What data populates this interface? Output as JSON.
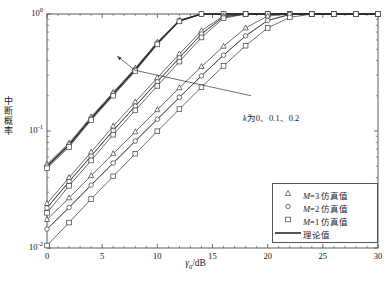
{
  "chart_data": {
    "type": "line",
    "title": "",
    "xlabel": "γ₀/dB",
    "ylabel": "中断概率",
    "xlim": [
      0,
      30
    ],
    "ylim": [
      0.01,
      1
    ],
    "yscale": "log",
    "xscale": "linear",
    "grid": false,
    "xticks": [
      0,
      5,
      10,
      15,
      20,
      25,
      30
    ],
    "xtick_labels": [
      "0",
      "5",
      "10",
      "15",
      "20",
      "25",
      "30"
    ],
    "yticks": [
      0.01,
      0.1,
      1
    ],
    "ytick_labels": [
      "10-2",
      "10-1",
      "100"
    ],
    "ytick_mantissa": "10",
    "ytick_exponents": [
      "0",
      "-1",
      "-2"
    ],
    "legend_position": "lower right",
    "annotations": [
      {
        "text": "k为0、0.1、0.2",
        "x": 18.5,
        "y": 0.2,
        "arrow_to_x": 8.0,
        "arrow_to_y": 0.33
      }
    ],
    "x": [
      0,
      2,
      4,
      6,
      8,
      10,
      12,
      14,
      16,
      18,
      20,
      22,
      24,
      26,
      28,
      30
    ],
    "series": [
      {
        "name": "k=0.2, M=3 仿真值",
        "group": "k=0.2",
        "marker": "triangle",
        "values": [
          0.052,
          0.079,
          0.132,
          0.214,
          0.345,
          0.575,
          0.885,
          1,
          1,
          1,
          1,
          1,
          1,
          1,
          1,
          1
        ]
      },
      {
        "name": "k=0.2, M=2 仿真值",
        "group": "k=0.2",
        "marker": "circle",
        "values": [
          0.05,
          0.076,
          0.128,
          0.207,
          0.335,
          0.562,
          0.875,
          1,
          1,
          1,
          1,
          1,
          1,
          1,
          1,
          1
        ]
      },
      {
        "name": "k=0.2, M=1 仿真值",
        "group": "k=0.2",
        "marker": "square",
        "values": [
          0.048,
          0.073,
          0.124,
          0.2,
          0.325,
          0.55,
          0.865,
          1,
          1,
          1,
          1,
          1,
          1,
          1,
          1,
          1
        ]
      },
      {
        "name": "k=0.1, M=3 仿真值",
        "group": "k=0.1",
        "marker": "triangle",
        "values": [
          0.024,
          0.04,
          0.066,
          0.11,
          0.177,
          0.285,
          0.455,
          0.72,
          0.965,
          1,
          1,
          1,
          1,
          1,
          1,
          1
        ]
      },
      {
        "name": "k=0.1, M=2 仿真值",
        "group": "k=0.1",
        "marker": "circle",
        "values": [
          0.022,
          0.037,
          0.061,
          0.101,
          0.163,
          0.263,
          0.422,
          0.675,
          0.945,
          1,
          1,
          1,
          1,
          1,
          1,
          1
        ]
      },
      {
        "name": "k=0.1, M=1 仿真值",
        "group": "k=0.1",
        "marker": "square",
        "values": [
          0.02,
          0.034,
          0.056,
          0.093,
          0.15,
          0.243,
          0.392,
          0.63,
          0.92,
          1,
          1,
          1,
          1,
          1,
          1,
          1
        ]
      },
      {
        "name": "k=0, M=3 仿真值",
        "group": "k=0",
        "marker": "triangle",
        "values": [
          0.0175,
          0.0268,
          0.0415,
          0.064,
          0.0985,
          0.152,
          0.234,
          0.355,
          0.53,
          0.76,
          0.96,
          1,
          1,
          1,
          1,
          1
        ]
      },
      {
        "name": "k=0, M=2 仿真值",
        "group": "k=0",
        "marker": "circle",
        "values": [
          0.0145,
          0.0222,
          0.0345,
          0.0532,
          0.082,
          0.126,
          0.194,
          0.296,
          0.445,
          0.65,
          0.88,
          0.99,
          1,
          1,
          1,
          1
        ]
      },
      {
        "name": "k=0, M=1 仿真值",
        "group": "k=0",
        "marker": "square",
        "values": [
          0.0105,
          0.0165,
          0.0262,
          0.041,
          0.064,
          0.0995,
          0.154,
          0.237,
          0.36,
          0.536,
          0.76,
          0.935,
          1,
          1,
          1,
          1
        ]
      },
      {
        "name": "理论值",
        "group": "theory",
        "marker": "none",
        "values": [
          0.05,
          0.076,
          0.128,
          0.207,
          0.335,
          0.562,
          0.875,
          1,
          1,
          1,
          1,
          1,
          1,
          1,
          1,
          1
        ]
      }
    ]
  },
  "axes": {
    "ytick_labels": [
      {
        "mantissa": "10",
        "exp": "0"
      },
      {
        "mantissa": "10",
        "exp": "-1"
      },
      {
        "mantissa": "10",
        "exp": "-2"
      }
    ],
    "xtick_labels": [
      "0",
      "5",
      "10",
      "15",
      "20",
      "25",
      "30"
    ],
    "xlabel_symbol": "γ",
    "xlabel_sub": "0",
    "xlabel_unit": "/dB",
    "ylabel_chars": [
      "中",
      "断",
      "概",
      "率"
    ]
  },
  "annotation": {
    "symbol": "k",
    "text": "为0、0.1、0.2"
  },
  "legend": {
    "entries": [
      {
        "marker": "triangle",
        "symbol": "M",
        "label": "=3 仿真值"
      },
      {
        "marker": "circle",
        "symbol": "M",
        "label": "=2 仿真值"
      },
      {
        "marker": "square",
        "symbol": "M",
        "label": "=1 仿真值"
      },
      {
        "marker": "line",
        "symbol": "",
        "label": "理论值"
      }
    ]
  },
  "colors": {
    "axis": "#4a4a4a",
    "curve": "#3a3a3a",
    "theory": "#2a2a2a",
    "background": "#ffffff"
  }
}
